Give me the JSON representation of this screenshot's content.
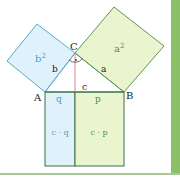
{
  "colors": {
    "blue_fill": "#dff2fb",
    "blue_stroke": "#5aa9cf",
    "blue_text": "#4d9cc8",
    "green_fill": "#eaf5cf",
    "green_stroke": "#5b9a52",
    "green_text": "#4f8f45",
    "altitude": "#e07a95",
    "black_stroke": "#3b6e48",
    "side_bar": "#8cc068",
    "bottom_line": "#a9c79a"
  },
  "labels": {
    "vertex_a": "A",
    "vertex_b": "B",
    "vertex_c": "C",
    "side_a": "a",
    "side_b": "b",
    "side_c": "c",
    "square_a": "a",
    "square_a_exp": "2",
    "square_b": "b",
    "square_b_exp": "2",
    "segment_q": "q",
    "segment_p": "p",
    "rect_cq": "c · q",
    "rect_cp": "c · p"
  }
}
